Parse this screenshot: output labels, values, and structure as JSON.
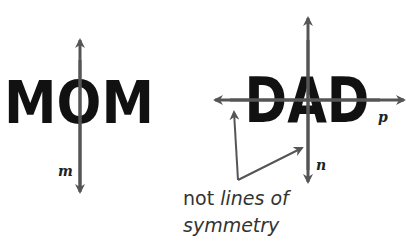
{
  "left_figure": {
    "word": "MOM",
    "line_label": "m",
    "line_type": "vertical line of symmetry"
  },
  "right_figure": {
    "word": "DAD",
    "vertical_line_label": "n",
    "horizontal_line_label": "p"
  },
  "annotation": {
    "line1_prefix": "not ",
    "line1_italic": "lines of",
    "line2": "symmetry"
  },
  "colors": {
    "letters": "#111111",
    "lines": "#555555",
    "text": "#333333"
  }
}
